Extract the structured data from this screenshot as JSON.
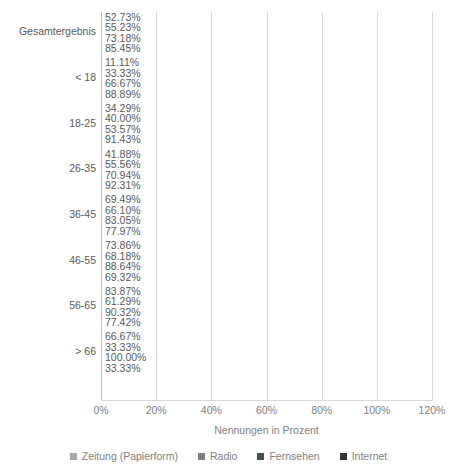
{
  "chart_data": {
    "type": "bar",
    "orientation": "horizontal",
    "title": "",
    "xlabel": "Nennungen in Prozent",
    "ylabel": "",
    "xlim": [
      0,
      120
    ],
    "xticks": [
      "0%",
      "20%",
      "40%",
      "60%",
      "80%",
      "100%",
      "120%"
    ],
    "xtick_values": [
      0,
      20,
      40,
      60,
      80,
      100,
      120
    ],
    "grid": true,
    "legend_position": "bottom",
    "value_suffix": "%",
    "categories": [
      "Gesamtergebnis",
      "< 18",
      "18-25",
      "26-35",
      "36-45",
      "46-55",
      "56-65",
      "> 66"
    ],
    "series": [
      {
        "name": "Zeitung (Papierform)",
        "color": "#a6a6a6",
        "values": [
          52.73,
          11.11,
          34.29,
          41.88,
          69.49,
          73.86,
          83.87,
          66.67
        ],
        "labels": [
          "52.73%",
          "11.11%",
          "34.29%",
          "41.88%",
          "69.49%",
          "73.86%",
          "83.87%",
          "66.67%"
        ]
      },
      {
        "name": "Radio",
        "color": "#7f7f7f",
        "values": [
          55.23,
          33.33,
          40.0,
          55.56,
          66.1,
          68.18,
          61.29,
          33.33
        ],
        "labels": [
          "55.23%",
          "33.33%",
          "40.00%",
          "55.56%",
          "66.10%",
          "68.18%",
          "61.29%",
          "33.33%"
        ]
      },
      {
        "name": "Fernsehen",
        "color": "#4d4d4d",
        "values": [
          73.18,
          66.67,
          53.57,
          70.94,
          83.05,
          88.64,
          90.32,
          100.0
        ],
        "labels": [
          "73.18%",
          "66.67%",
          "53.57%",
          "70.94%",
          "83.05%",
          "88.64%",
          "90.32%",
          "100.00%"
        ]
      },
      {
        "name": "Internet",
        "color": "#333333",
        "values": [
          85.45,
          88.89,
          91.43,
          92.31,
          77.97,
          69.32,
          77.42,
          33.33
        ],
        "labels": [
          "85.45%",
          "88.89%",
          "91.43%",
          "92.31%",
          "77.97%",
          "69.32%",
          "77.42%",
          "33.33%"
        ]
      }
    ]
  },
  "colors": {
    "text": "#595959",
    "axis_text": "#808080",
    "gridline": "#d9d9d9",
    "background": "#ffffff"
  }
}
